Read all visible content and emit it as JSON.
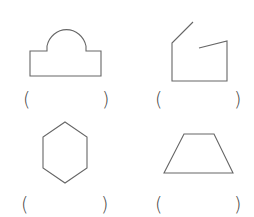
{
  "worksheet": {
    "items": [
      {
        "shape": "rectangle-with-semicircle",
        "open": "(",
        "close": ")",
        "answer": ""
      },
      {
        "shape": "open-polygon",
        "open": "(",
        "close": ")",
        "answer": ""
      },
      {
        "shape": "hexagon",
        "open": "(",
        "close": ")",
        "answer": ""
      },
      {
        "shape": "trapezoid",
        "open": "(",
        "close": ")",
        "answer": ""
      }
    ],
    "stroke_color": "#666666"
  }
}
